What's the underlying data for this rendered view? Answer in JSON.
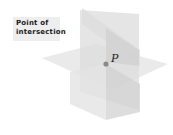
{
  "figure": {
    "callout": {
      "lines": [
        "Point of",
        "intersection"
      ]
    },
    "point": {
      "label": "P",
      "color": "#8a8a8a"
    },
    "planes": [
      {
        "name": "horizontal-plane",
        "fill": "#e6e6e6"
      },
      {
        "name": "vertical-plane-front",
        "fill": "#d9d9d9"
      },
      {
        "name": "vertical-plane-diagonal",
        "fill": "#dedede"
      }
    ],
    "colors": {
      "background": "#ffffff",
      "callout_bg": "#eeeeee",
      "text": "#1a1a1a"
    }
  }
}
